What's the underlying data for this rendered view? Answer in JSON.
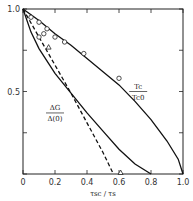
{
  "chart_data": {
    "type": "line",
    "title": "",
    "xlabel": "τsc / τs",
    "ylabel": "",
    "xlim": [
      0,
      1.0
    ],
    "ylim": [
      0,
      1.0
    ],
    "x_ticks": [
      "0",
      "0.2",
      "0.4",
      "0.6",
      "0.8",
      "1.0"
    ],
    "y_ticks": [
      "0",
      "0.5",
      "1.0"
    ],
    "grid": false,
    "series": [
      {
        "name": "Tc / Tc0",
        "style": "solid",
        "x": [
          0,
          0.1,
          0.2,
          0.3,
          0.4,
          0.5,
          0.6,
          0.7,
          0.8,
          0.9,
          0.97,
          1.0
        ],
        "y": [
          1.0,
          0.93,
          0.85,
          0.78,
          0.7,
          0.62,
          0.54,
          0.44,
          0.33,
          0.2,
          0.09,
          0.0
        ]
      },
      {
        "name": "ΔG / Δ(0)",
        "style": "solid",
        "x": [
          0,
          0.05,
          0.1,
          0.2,
          0.3,
          0.4,
          0.5,
          0.6,
          0.7,
          0.8
        ],
        "y": [
          1.0,
          0.86,
          0.76,
          0.61,
          0.49,
          0.37,
          0.26,
          0.15,
          0.06,
          0.0
        ]
      },
      {
        "name": "dashed",
        "style": "dashed",
        "x": [
          0,
          0.1,
          0.2,
          0.3,
          0.4,
          0.5,
          0.565
        ],
        "y": [
          1.0,
          0.83,
          0.66,
          0.49,
          0.31,
          0.13,
          0.0
        ]
      },
      {
        "name": "circles",
        "style": "marker-circle",
        "x": [
          0.05,
          0.1,
          0.15,
          0.2,
          0.26,
          0.38,
          0.6,
          0.1,
          0.13
        ],
        "y": [
          0.95,
          0.92,
          0.88,
          0.83,
          0.8,
          0.73,
          0.58,
          0.83,
          0.85
        ]
      },
      {
        "name": "triangles",
        "style": "marker-triangle",
        "x": [
          0.16,
          0.61
        ],
        "y": [
          0.76,
          0.0
        ]
      }
    ],
    "annotations": [
      {
        "text_num": "Tc",
        "text_den": "Tc0",
        "x": 0.72,
        "y": 0.5
      },
      {
        "text_num": "ΔG",
        "text_den": "Δ(0)",
        "x": 0.2,
        "y": 0.37
      }
    ]
  }
}
